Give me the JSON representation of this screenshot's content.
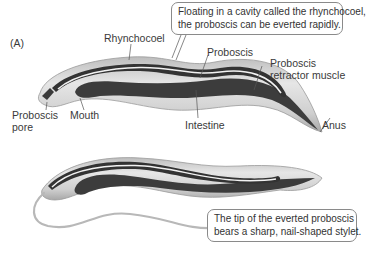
{
  "figure": {
    "panel_label": "(A)",
    "labels": {
      "rhynchocoel": "Rhynchocoel",
      "proboscis": "Proboscis",
      "retractor_line1": "Proboscis",
      "retractor_line2": "retractor muscle",
      "pore_line1": "Proboscis",
      "pore_line2": "pore",
      "mouth": "Mouth",
      "intestine": "Intestine",
      "anus": "Anus"
    },
    "callouts": {
      "top_line1": "Floating in a cavity called the rhynchocoel,",
      "top_line2": "the proboscis can be everted rapidly.",
      "bottom_line1": "The tip of the everted proboscis",
      "bottom_line2": "bears a sharp, nail-shaped stylet."
    },
    "colors": {
      "body_fill": "#c9c9c9",
      "body_light": "#e4e4e4",
      "body_outline": "#9a9a9a",
      "gut_dark": "#3c3c3c",
      "proboscis_light": "#f0f0f0",
      "leader_line": "#555555",
      "callout_border": "#8a8a8a"
    }
  }
}
